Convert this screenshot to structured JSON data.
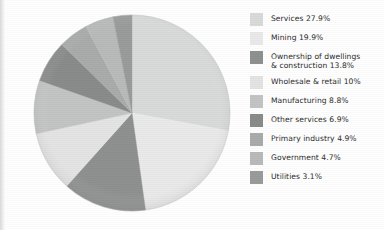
{
  "chart_data": {
    "type": "pie",
    "title": "",
    "subtitle": "",
    "xlabel": "",
    "ylabel": "",
    "legend_position": "right",
    "grid": false,
    "start_angle_deg": 0,
    "direction": "clockwise",
    "unit": "%",
    "categories": [
      "Services",
      "Mining",
      "Ownership of dwellings & construction",
      "Wholesale & retail",
      "Manufacturing",
      "Other services",
      "Primary industry",
      "Government",
      "Utilities"
    ],
    "values": [
      27.9,
      19.9,
      13.8,
      10,
      8.8,
      6.9,
      4.9,
      4.7,
      3.1
    ],
    "colors": [
      "#d9dbda",
      "#e9eae9",
      "#8f9190",
      "#e3e4e3",
      "#c3c5c4",
      "#8a8c8b",
      "#aaacab",
      "#b9bbba",
      "#9a9c9b"
    ],
    "slices": [
      {
        "label": "Services",
        "value": 27.9,
        "display": "27.9%",
        "color": "#d9dbda"
      },
      {
        "label": "Mining",
        "value": 19.9,
        "display": "19.9%",
        "color": "#e9eae9"
      },
      {
        "label": "Ownership of dwellings & construction",
        "value": 13.8,
        "display": "13.8%",
        "color": "#8f9190"
      },
      {
        "label": "Wholesale & retail",
        "value": 10,
        "display": "10%",
        "color": "#e3e4e3"
      },
      {
        "label": "Manufacturing",
        "value": 8.8,
        "display": "8.8%",
        "color": "#c3c5c4"
      },
      {
        "label": "Other services",
        "value": 6.9,
        "display": "6.9%",
        "color": "#8a8c8b"
      },
      {
        "label": "Primary industry",
        "value": 4.9,
        "display": "4.9%",
        "color": "#aaacab"
      },
      {
        "label": "Government",
        "value": 4.7,
        "display": "4.7%",
        "color": "#b9bbba"
      },
      {
        "label": "Utilities",
        "value": 3.1,
        "display": "3.1%",
        "color": "#9a9c9b"
      }
    ]
  },
  "legend": {
    "items": [
      {
        "text": "Services 27.9%",
        "color": "#d9dbda"
      },
      {
        "text": "Mining 19.9%",
        "color": "#e9eae9"
      },
      {
        "text": "Ownership of dwellings\n& construction 13.8%",
        "color": "#8f9190"
      },
      {
        "text": "Wholesale & retail 10%",
        "color": "#e3e4e3"
      },
      {
        "text": "Manufacturing 8.8%",
        "color": "#c3c5c4"
      },
      {
        "text": "Other services 6.9%",
        "color": "#8a8c8b"
      },
      {
        "text": "Primary industry 4.9%",
        "color": "#aaacab"
      },
      {
        "text": "Government 4.7%",
        "color": "#b9bbba"
      },
      {
        "text": "Utilities 3.1%",
        "color": "#9a9c9b"
      }
    ]
  },
  "pie": {
    "center_x": 100,
    "center_y": 100,
    "radius": 98
  }
}
